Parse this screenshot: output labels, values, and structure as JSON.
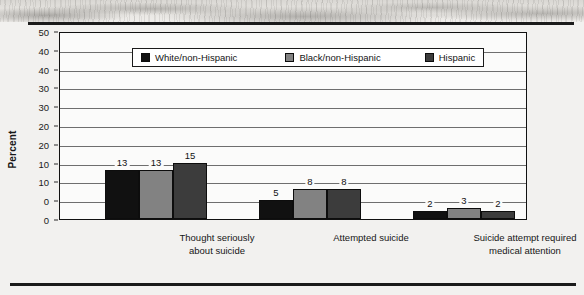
{
  "figure": {
    "ylabel": "Percent",
    "decor": {
      "top_band": "scanned-photo-texture-band",
      "rule_color": "#1b1b1b"
    }
  },
  "chart_data": {
    "type": "bar",
    "title": "",
    "subtitle": "",
    "xlabel": "",
    "ylabel": "Percent",
    "ylim": [
      0,
      50
    ],
    "ytick_step": 5,
    "ytick_labels": [
      "50",
      "40",
      "40",
      "30",
      "30",
      "20",
      "20",
      "10",
      "10",
      "0",
      "0"
    ],
    "ytick_values": [
      50,
      45,
      40,
      35,
      30,
      25,
      20,
      15,
      10,
      5,
      0
    ],
    "grid": true,
    "grid_orientation": "horizontal",
    "legend_position": "top-inside",
    "categories": [
      "Thought seriously about suicide",
      "Attempted suicide",
      "Suicide attempt required medical attention"
    ],
    "category_lines": [
      [
        "Thought seriously",
        "about suicide"
      ],
      [
        "Attempted suicide",
        ""
      ],
      [
        "Suicide attempt required",
        "medical attention"
      ]
    ],
    "series": [
      {
        "name": "White/non-Hispanic",
        "color": "#111111",
        "values": [
          13,
          5,
          2
        ]
      },
      {
        "name": "Black/non-Hispanic",
        "color": "#828282",
        "values": [
          13,
          8,
          3
        ]
      },
      {
        "name": "Hispanic",
        "color": "#3c3c3c",
        "values": [
          15,
          8,
          2
        ]
      }
    ],
    "data_labels": [
      [
        "13",
        "13",
        "15"
      ],
      [
        "5",
        "8",
        "8"
      ],
      [
        "2",
        "3",
        "2"
      ]
    ]
  }
}
